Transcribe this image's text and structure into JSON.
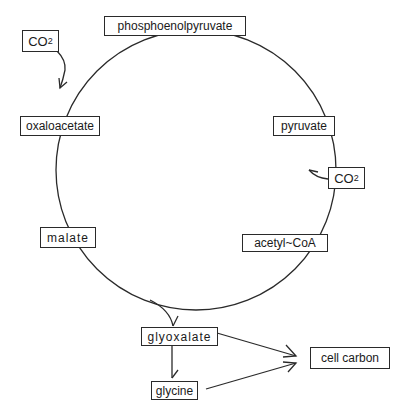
{
  "diagram": {
    "type": "metabolic-cycle",
    "cycle_nodes": [
      {
        "id": "pep",
        "label": "phosphoenolpyruvate"
      },
      {
        "id": "pyruvate",
        "label": "pyruvate"
      },
      {
        "id": "acetyl_coa",
        "label": "acetyl~CoA"
      },
      {
        "id": "malate",
        "label": "malate"
      },
      {
        "id": "oxaloacetate",
        "label": "oxaloacetate"
      }
    ],
    "side_inputs": [
      {
        "id": "co2_left",
        "label_base": "CO",
        "label_sub": "2",
        "joins": "pep-to-oxaloacetate"
      },
      {
        "id": "co2_right",
        "label_base": "CO",
        "label_sub": "2",
        "joins": "pyruvate-to-acetyl_coa"
      }
    ],
    "branch_nodes": [
      {
        "id": "glyoxalate",
        "label": "glyoxalate"
      },
      {
        "id": "glycine",
        "label": "glycine"
      },
      {
        "id": "cell_carbon",
        "label": "cell carbon"
      }
    ],
    "edges": [
      {
        "from": "malate",
        "to": "glyoxalate"
      },
      {
        "from": "glyoxalate",
        "to": "glycine"
      },
      {
        "from": "glyoxalate",
        "to": "cell_carbon"
      },
      {
        "from": "glycine",
        "to": "cell_carbon"
      }
    ],
    "colors": {
      "line": "#2a2a2a",
      "background": "#ffffff"
    }
  }
}
